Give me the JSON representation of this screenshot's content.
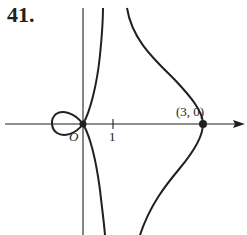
{
  "problem_number": "41.",
  "figure": {
    "origin_label": "O",
    "x_tick_label": "1",
    "point_label": "(3, 0)",
    "colors": {
      "ink": "#231f20",
      "background": "#ffffff"
    }
  }
}
